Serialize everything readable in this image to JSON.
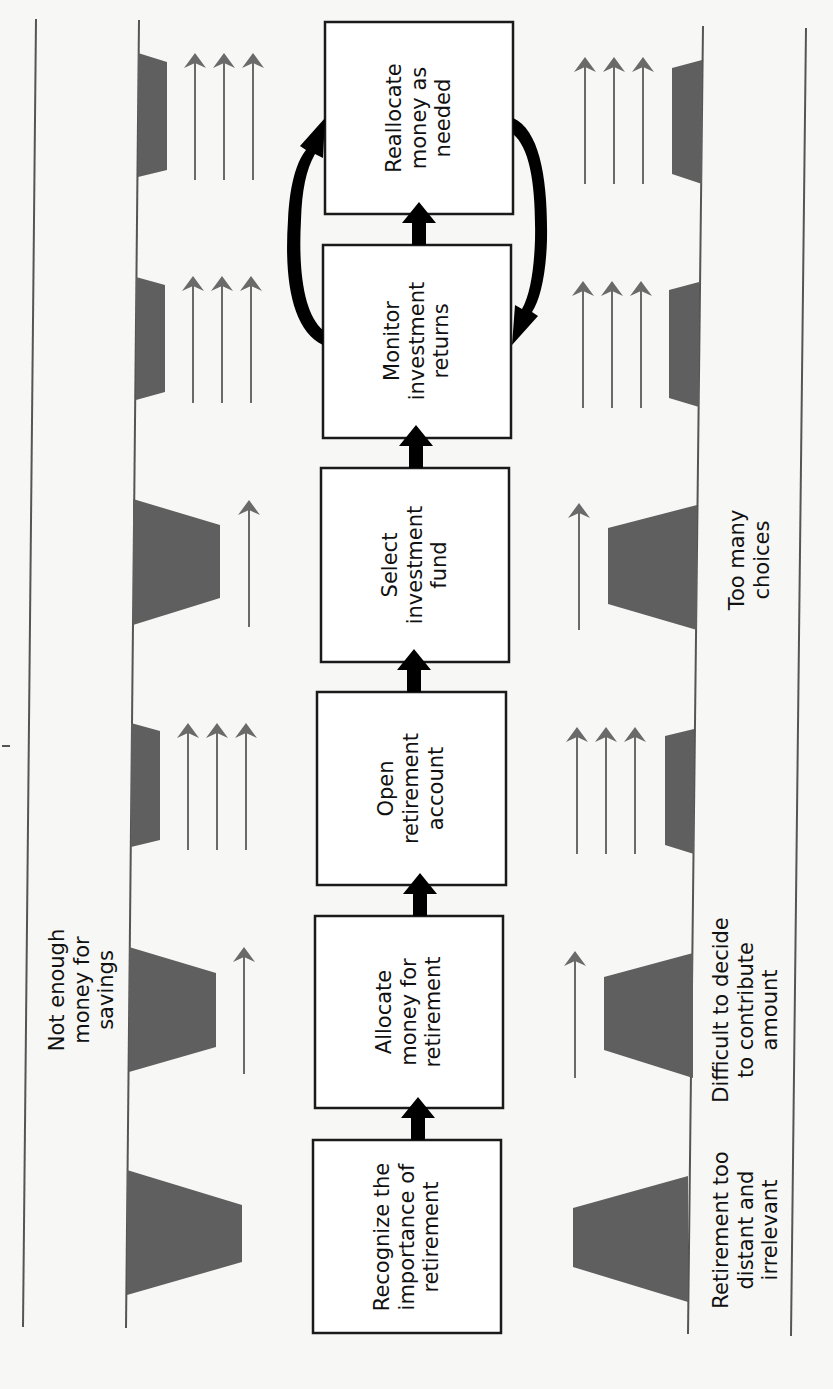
{
  "diagram": {
    "orientation": "rotated 90 degrees counter-clockwise",
    "process_steps": [
      {
        "id": 1,
        "label": "Recognize the\nimportance of\nretirement"
      },
      {
        "id": 2,
        "label": "Allocate\nmoney for\nretirement"
      },
      {
        "id": 3,
        "label": "Open\nretirement\naccount"
      },
      {
        "id": 4,
        "label": "Select\ninvestment\nfund"
      },
      {
        "id": 5,
        "label": "Monitor\ninvestment\nreturns"
      },
      {
        "id": 6,
        "label": "Reallocate\nmoney as\nneeded"
      }
    ],
    "feedback_loop": {
      "between": [
        "Monitor investment returns",
        "Reallocate money as needed"
      ],
      "direction": "bidirectional cycle"
    },
    "barriers_top_side": [
      {
        "step": 1,
        "size": "large",
        "label": ""
      },
      {
        "step": 2,
        "size": "large",
        "label": "Not enough\nmoney for\nsavings"
      },
      {
        "step": 3,
        "size": "small",
        "label": ""
      },
      {
        "step": 4,
        "size": "large",
        "label": ""
      },
      {
        "step": 5,
        "size": "small",
        "label": ""
      },
      {
        "step": 6,
        "size": "small",
        "label": ""
      }
    ],
    "barriers_bottom_side": [
      {
        "step": 1,
        "size": "large",
        "label": "Retirement too\ndistant and\nirrelevant"
      },
      {
        "step": 2,
        "size": "large",
        "label": "Difficult to decide\nto contribute\namount"
      },
      {
        "step": 3,
        "size": "small",
        "label": ""
      },
      {
        "step": 4,
        "size": "large",
        "label": "Too many\nchoices"
      },
      {
        "step": 5,
        "size": "small",
        "label": ""
      },
      {
        "step": 6,
        "size": "small",
        "label": ""
      }
    ],
    "driving_forces": [
      {
        "step": 1,
        "count": 0
      },
      {
        "step": 2,
        "count": 1
      },
      {
        "step": 3,
        "count": 3
      },
      {
        "step": 4,
        "count": 1
      },
      {
        "step": 5,
        "count": 3
      },
      {
        "step": 6,
        "count": 3
      }
    ],
    "colors": {
      "barrier_fill": "#5f5f5f",
      "force_arrow": "#6a6a6a",
      "flow_arrow": "#000000",
      "box_border": "#1a1a1a",
      "background": "#f7f7f5"
    }
  }
}
